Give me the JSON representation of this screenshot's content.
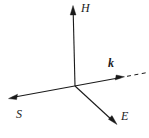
{
  "diagram": {
    "background_color": "#ffffff",
    "line_color": "#1a1a1a",
    "origin": {
      "x": 75,
      "y": 85
    },
    "axes": [
      {
        "id": "H",
        "label": "H",
        "style": "italic",
        "bold": false,
        "description": "magnetic-field-axis",
        "tip": {
          "x": 73,
          "y": 6
        },
        "dashed_extension": false
      },
      {
        "id": "k",
        "label": "k",
        "style": "italic",
        "bold": true,
        "description": "wave-vector-axis",
        "tip": {
          "x": 124,
          "y": 77
        },
        "dashed_extension": true,
        "dashed_end": {
          "x": 146,
          "y": 73
        }
      },
      {
        "id": "E",
        "label": "E",
        "style": "italic",
        "bold": false,
        "description": "electric-field-axis",
        "tip": {
          "x": 116,
          "y": 124
        },
        "dashed_extension": false
      },
      {
        "id": "S",
        "label": "S",
        "style": "italic",
        "bold": false,
        "description": "poynting-vector-axis",
        "tip": {
          "x": 9,
          "y": 98
        },
        "dashed_extension": false
      }
    ]
  }
}
